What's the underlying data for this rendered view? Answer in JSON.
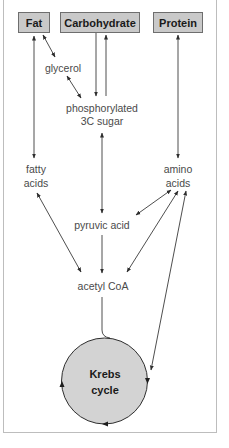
{
  "diagram": {
    "sources": [
      {
        "id": "fat",
        "label": "Fat"
      },
      {
        "id": "carbohydrate",
        "label": "Carbohydrate"
      },
      {
        "id": "protein",
        "label": "Protein"
      }
    ],
    "intermediates": {
      "glycerol": "glycerol",
      "phosphorylated_line1": "phosphorylated",
      "phosphorylated_line2": "3C sugar",
      "fatty_line1": "fatty",
      "fatty_line2": "acids",
      "amino_line1": "amino",
      "amino_line2": "acids",
      "pyruvic": "pyruvic acid",
      "acetyl": "acetyl CoA"
    },
    "cycle": {
      "line1": "Krebs",
      "line2": "cycle"
    },
    "colors": {
      "box_fill": "#c9c9c9",
      "box_border": "#6e6e6e",
      "circle_fill": "#d3d3d3",
      "arrow": "#3a3a3a",
      "text": "#4a4a4a",
      "frame": "#bdbdbd"
    },
    "edges": [
      {
        "from": "Fat",
        "to": "fatty acids",
        "type": "bidirectional"
      },
      {
        "from": "Fat",
        "to": "glycerol",
        "type": "bidirectional"
      },
      {
        "from": "glycerol",
        "to": "phosphorylated 3C sugar",
        "type": "bidirectional"
      },
      {
        "from": "Carbohydrate",
        "to": "phosphorylated 3C sugar",
        "type": "directed"
      },
      {
        "from": "phosphorylated 3C sugar",
        "to": "Carbohydrate",
        "type": "directed"
      },
      {
        "from": "Protein",
        "to": "amino acids",
        "type": "bidirectional"
      },
      {
        "from": "phosphorylated 3C sugar",
        "to": "pyruvic acid",
        "type": "bidirectional"
      },
      {
        "from": "pyruvic acid",
        "to": "acetyl CoA",
        "type": "directed"
      },
      {
        "from": "fatty acids",
        "to": "acetyl CoA",
        "type": "bidirectional"
      },
      {
        "from": "amino acids",
        "to": "pyruvic acid",
        "type": "bidirectional"
      },
      {
        "from": "amino acids",
        "to": "acetyl CoA",
        "type": "bidirectional"
      },
      {
        "from": "amino acids",
        "to": "Krebs cycle",
        "type": "bidirectional"
      },
      {
        "from": "acetyl CoA",
        "to": "Krebs cycle",
        "type": "directed"
      }
    ]
  }
}
